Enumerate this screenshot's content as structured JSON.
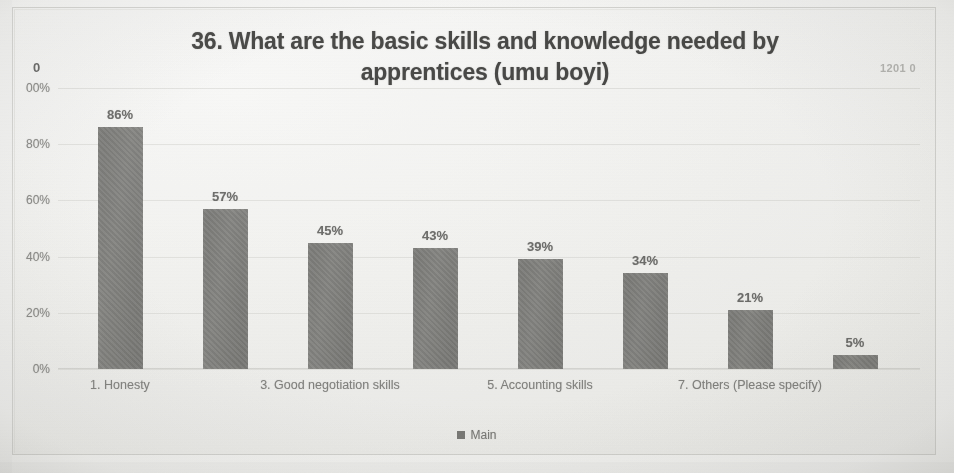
{
  "chart_data": {
    "type": "bar",
    "title": "36. What are the basic skills and knowledge needed by apprentices (umu boyi)",
    "title_line1": "36. What are the basic skills and knowledge needed by",
    "title_line2": "apprentices (umu boyi)",
    "xlabel": "",
    "ylabel": "",
    "ylim": [
      0,
      100
    ],
    "grid": true,
    "legend_position": "bottom",
    "series": [
      {
        "name": "Main",
        "values": [
          86,
          57,
          45,
          43,
          39,
          34,
          21,
          5
        ]
      }
    ],
    "categories": [
      "1. Honesty",
      "2.",
      "3. Good negotiation skills",
      "4.",
      "5. Accounting skills",
      "6.",
      "7. Others (Please specify)",
      "8."
    ],
    "visible_category_labels": [
      "1. Honesty",
      "3. Good negotiation skills",
      "5. Accounting skills",
      "7. Others (Please specify)"
    ],
    "data_labels": [
      "86%",
      "57%",
      "45%",
      "43%",
      "39%",
      "34%",
      "21%",
      "5%"
    ],
    "ytick_labels": [
      "00%",
      "80%",
      "60%",
      "40%",
      "20%",
      "0%"
    ],
    "ytick_values": [
      100,
      80,
      60,
      40,
      20,
      0
    ],
    "bar_color": "#7d7d7a",
    "gridline_color": "#e6e6e3"
  },
  "legend": {
    "entries": [
      {
        "label": "Main",
        "color": "#7d7d7a",
        "marker": "square-marker-icon"
      }
    ]
  },
  "annotations": {
    "top_left_mark": "0",
    "top_right_mark": "1201 0"
  }
}
